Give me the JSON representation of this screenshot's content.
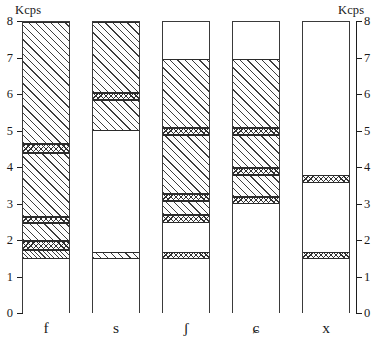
{
  "axes": {
    "unit_left": "Kcps",
    "unit_right": "Kcps",
    "y_ticks": [
      "0",
      "1",
      "2",
      "3",
      "4",
      "5",
      "6",
      "7",
      "8"
    ],
    "y_min": 0,
    "y_max": 8,
    "x_categories": [
      "f",
      "s",
      "ʃ",
      "ɕ",
      "x"
    ]
  },
  "chart_data": {
    "type": "bar",
    "title": "",
    "subtitle": "",
    "xlabel": "",
    "ylabel": "Kcps",
    "ylim": [
      0,
      8
    ],
    "grid": false,
    "legend": "none",
    "stacked": true,
    "orientation": "vertical",
    "categories": [
      "f",
      "s",
      "ʃ",
      "ɕ",
      "x"
    ],
    "y_tick_labels": [
      "0",
      "1",
      "2",
      "3",
      "4",
      "5",
      "6",
      "7",
      "8"
    ],
    "patterns": {
      "blank": "unfilled / white",
      "diagonal": "coarse diagonal hatch",
      "diagonal_fine": "fine diagonal hatch",
      "cross": "cross-hatch"
    },
    "bars": [
      {
        "category": "f",
        "total": 8.0,
        "segments": [
          {
            "from": 0.0,
            "to": 1.5,
            "pattern": "blank"
          },
          {
            "from": 1.5,
            "to": 1.75,
            "pattern": "diagonal_fine"
          },
          {
            "from": 1.75,
            "to": 2.0,
            "pattern": "cross"
          },
          {
            "from": 2.0,
            "to": 2.5,
            "pattern": "diagonal"
          },
          {
            "from": 2.5,
            "to": 2.65,
            "pattern": "cross"
          },
          {
            "from": 2.65,
            "to": 4.4,
            "pattern": "diagonal"
          },
          {
            "from": 4.4,
            "to": 4.65,
            "pattern": "cross"
          },
          {
            "from": 4.65,
            "to": 8.0,
            "pattern": "diagonal"
          }
        ]
      },
      {
        "category": "s",
        "total": 8.0,
        "segments": [
          {
            "from": 0.0,
            "to": 1.5,
            "pattern": "blank"
          },
          {
            "from": 1.5,
            "to": 1.7,
            "pattern": "diagonal"
          },
          {
            "from": 1.7,
            "to": 5.0,
            "pattern": "blank"
          },
          {
            "from": 5.0,
            "to": 5.85,
            "pattern": "diagonal"
          },
          {
            "from": 5.85,
            "to": 6.05,
            "pattern": "cross"
          },
          {
            "from": 6.05,
            "to": 8.0,
            "pattern": "diagonal"
          }
        ]
      },
      {
        "category": "ʃ",
        "total": 8.0,
        "segments": [
          {
            "from": 0.0,
            "to": 1.5,
            "pattern": "blank"
          },
          {
            "from": 1.5,
            "to": 1.7,
            "pattern": "cross"
          },
          {
            "from": 1.7,
            "to": 2.5,
            "pattern": "blank"
          },
          {
            "from": 2.5,
            "to": 2.7,
            "pattern": "cross"
          },
          {
            "from": 2.7,
            "to": 3.1,
            "pattern": "diagonal"
          },
          {
            "from": 3.1,
            "to": 3.3,
            "pattern": "cross"
          },
          {
            "from": 3.3,
            "to": 4.9,
            "pattern": "diagonal"
          },
          {
            "from": 4.9,
            "to": 5.1,
            "pattern": "cross"
          },
          {
            "from": 5.1,
            "to": 7.0,
            "pattern": "diagonal"
          },
          {
            "from": 7.0,
            "to": 8.0,
            "pattern": "blank"
          }
        ]
      },
      {
        "category": "ɕ",
        "total": 8.0,
        "segments": [
          {
            "from": 0.0,
            "to": 3.0,
            "pattern": "blank"
          },
          {
            "from": 3.0,
            "to": 3.2,
            "pattern": "cross"
          },
          {
            "from": 3.2,
            "to": 3.8,
            "pattern": "diagonal"
          },
          {
            "from": 3.8,
            "to": 4.0,
            "pattern": "cross"
          },
          {
            "from": 4.0,
            "to": 4.9,
            "pattern": "diagonal"
          },
          {
            "from": 4.9,
            "to": 5.1,
            "pattern": "cross"
          },
          {
            "from": 5.1,
            "to": 7.0,
            "pattern": "diagonal"
          },
          {
            "from": 7.0,
            "to": 8.0,
            "pattern": "blank"
          }
        ]
      },
      {
        "category": "x",
        "total": 8.0,
        "segments": [
          {
            "from": 0.0,
            "to": 1.5,
            "pattern": "blank"
          },
          {
            "from": 1.5,
            "to": 1.7,
            "pattern": "cross"
          },
          {
            "from": 1.7,
            "to": 3.6,
            "pattern": "blank"
          },
          {
            "from": 3.6,
            "to": 3.8,
            "pattern": "cross"
          },
          {
            "from": 3.8,
            "to": 8.0,
            "pattern": "blank"
          }
        ]
      }
    ]
  }
}
